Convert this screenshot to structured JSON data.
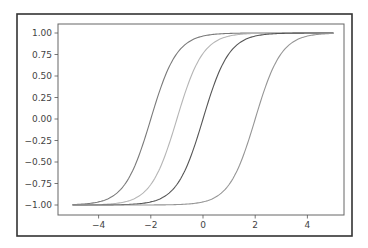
{
  "chart_data": {
    "type": "line",
    "title": "",
    "xlabel": "",
    "ylabel": "",
    "xlim": [
      -5.5,
      5.5
    ],
    "ylim": [
      -1.1,
      1.1
    ],
    "grid": false,
    "legend": null,
    "x_ticks": [
      -4,
      -2,
      0,
      2,
      4
    ],
    "x_tick_labels": [
      "−4",
      "−2",
      "0",
      "2",
      "4"
    ],
    "y_ticks": [
      1.0,
      0.75,
      0.5,
      0.25,
      0.0,
      -0.25,
      -0.5,
      -0.75,
      -1.0
    ],
    "y_tick_labels": [
      "1.00",
      "0.75",
      "0.50",
      "0.25",
      "0.00",
      "−0.25",
      "−0.50",
      "−0.75",
      "−1.00"
    ],
    "x_range": [
      -5,
      5
    ],
    "series": [
      {
        "name": "tanh(x+2)",
        "shift": -2,
        "color": "#7a7a7a",
        "x": [
          -5,
          -4,
          -3,
          -2.5,
          -2,
          -1.5,
          -1,
          0,
          1,
          2,
          3,
          4,
          5
        ],
        "values": [
          -0.995,
          -0.964,
          -0.762,
          -0.462,
          0.0,
          0.462,
          0.762,
          0.964,
          0.995,
          0.999,
          1.0,
          1.0,
          1.0
        ]
      },
      {
        "name": "tanh(x+1)",
        "shift": -1,
        "color": "#b5b5b5",
        "x": [
          -5,
          -4,
          -3,
          -2,
          -1.5,
          -1,
          -0.5,
          0,
          1,
          2,
          3,
          4,
          5
        ],
        "values": [
          -0.999,
          -0.995,
          -0.964,
          -0.762,
          -0.462,
          0.0,
          0.462,
          0.762,
          0.964,
          0.995,
          0.999,
          1.0,
          1.0
        ]
      },
      {
        "name": "tanh(x)",
        "shift": 0,
        "color": "#555555",
        "x": [
          -5,
          -4,
          -3,
          -2,
          -1,
          -0.5,
          0,
          0.5,
          1,
          2,
          3,
          4,
          5
        ],
        "values": [
          -1.0,
          -0.999,
          -0.995,
          -0.964,
          -0.762,
          -0.462,
          0.0,
          0.462,
          0.762,
          0.964,
          0.995,
          0.999,
          1.0
        ]
      },
      {
        "name": "tanh(x-2)",
        "shift": 2,
        "color": "#959595",
        "x": [
          -5,
          -4,
          -3,
          -2,
          -1,
          0,
          1,
          1.5,
          2,
          2.5,
          3,
          4,
          5
        ],
        "values": [
          -1.0,
          -1.0,
          -1.0,
          -0.999,
          -0.995,
          -0.964,
          -0.762,
          -0.462,
          0.0,
          0.462,
          0.762,
          0.964,
          0.995
        ]
      }
    ]
  },
  "layout": {
    "frame": {
      "x": 17,
      "y": 14,
      "w": 335,
      "h": 222
    },
    "plot": {
      "x": 58,
      "y": 24,
      "w": 286,
      "h": 191
    },
    "x_px_per_unit": 26.1,
    "x_zero_px": 203,
    "y_px_per_unit": 86,
    "y_zero_px": 119
  }
}
